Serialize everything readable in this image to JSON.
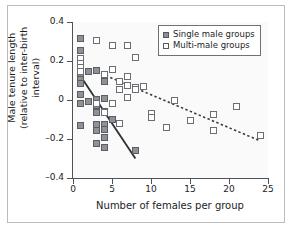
{
  "chart_data": {
    "type": "scatter",
    "title": "",
    "xlabel": "Number of females per group",
    "ylabel_line1": "Male tenure length",
    "ylabel_line2": "(relative to inter-birth interval)",
    "xlim": [
      0,
      25
    ],
    "ylim": [
      -0.4,
      0.4
    ],
    "xticks": [
      0,
      5,
      10,
      15,
      20,
      25
    ],
    "xtick_labels": [
      "0",
      "5",
      "10",
      "15",
      "20",
      "25"
    ],
    "yticks": [
      0.4,
      0.2,
      0,
      -0.2,
      -0.4
    ],
    "ytick_labels": [
      "0.4",
      "0.2",
      "0",
      "–0.2",
      "–0.4"
    ],
    "grid": false,
    "legend_position": "top-right",
    "legend": [
      {
        "label": "Single male groups",
        "marker": "filled-square",
        "color": "#8c9096"
      },
      {
        "label": "Multi-male groups",
        "marker": "open-square",
        "color": "#ffffff"
      }
    ],
    "series": [
      {
        "name": "Single male groups",
        "marker": "filled-square",
        "points": [
          [
            1,
            0.315
          ],
          [
            1,
            0.255
          ],
          [
            1,
            0.215
          ],
          [
            1,
            0.185
          ],
          [
            1,
            0.165
          ],
          [
            1,
            0.145
          ],
          [
            1,
            0.125
          ],
          [
            1,
            0.105
          ],
          [
            1,
            0.085
          ],
          [
            1,
            0.03
          ],
          [
            1,
            -0.02
          ],
          [
            1,
            -0.13
          ],
          [
            2,
            0.145
          ],
          [
            2,
            -0.005
          ],
          [
            3,
            0.15
          ],
          [
            3,
            0.005
          ],
          [
            3,
            -0.03
          ],
          [
            3,
            -0.065
          ],
          [
            3,
            -0.125
          ],
          [
            3,
            -0.155
          ],
          [
            3,
            -0.225
          ],
          [
            4,
            0.13
          ],
          [
            4,
            0.095
          ],
          [
            4,
            0.01
          ],
          [
            4,
            -0.06
          ],
          [
            4,
            -0.125
          ],
          [
            4,
            -0.15
          ],
          [
            4,
            -0.19
          ],
          [
            4,
            -0.245
          ],
          [
            5,
            -0.1
          ],
          [
            8,
            -0.26
          ]
        ]
      },
      {
        "name": "Multi-male groups",
        "marker": "open-square",
        "points": [
          [
            1,
            0.215
          ],
          [
            1,
            0.185
          ],
          [
            1,
            0.165
          ],
          [
            1,
            0.145
          ],
          [
            3,
            0.305
          ],
          [
            3,
            -0.02
          ],
          [
            4,
            0.13
          ],
          [
            4,
            -0.065
          ],
          [
            5,
            0.28
          ],
          [
            5,
            0.155
          ],
          [
            5,
            -0.02
          ],
          [
            6,
            0.095
          ],
          [
            6,
            0.055
          ],
          [
            6,
            -0.12
          ],
          [
            7,
            0.28
          ],
          [
            7,
            0.12
          ],
          [
            7,
            0.075
          ],
          [
            7,
            0.015
          ],
          [
            8,
            0.22
          ],
          [
            8,
            0.065
          ],
          [
            8,
            0.055
          ],
          [
            9,
            0.07
          ],
          [
            10,
            -0.07
          ],
          [
            10,
            -0.09
          ],
          [
            12,
            -0.14
          ],
          [
            13,
            0.0
          ],
          [
            15,
            -0.105
          ],
          [
            18,
            -0.075
          ],
          [
            18,
            -0.155
          ],
          [
            21,
            -0.035
          ],
          [
            24,
            -0.18
          ]
        ]
      }
    ],
    "trend_lines": [
      {
        "name": "single-male-trend",
        "style": "solid",
        "color": "#2d2f33",
        "x0": 1,
        "y0": 0.12,
        "x1": 8,
        "y1": -0.3
      },
      {
        "name": "multi-male-trend",
        "style": "dashed",
        "color": "#3a3c40",
        "x0": 4.2,
        "y0": 0.125,
        "x1": 24,
        "y1": -0.21
      }
    ]
  },
  "figure": {
    "background": "#ffffff",
    "plot_background": "#fafafa",
    "axis_color": "#4f5256",
    "border_color": "#b9bcc0"
  }
}
